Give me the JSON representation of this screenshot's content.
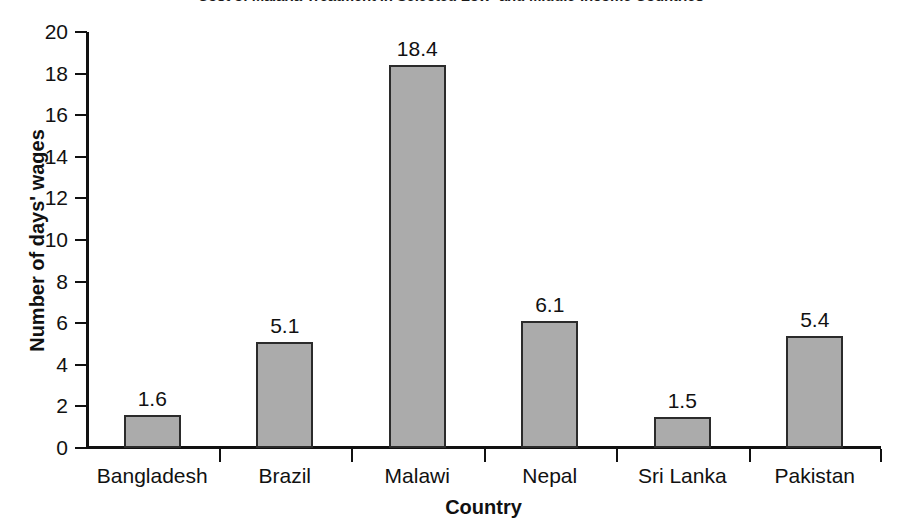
{
  "chart_data": {
    "type": "bar",
    "title": "Cost of Malaria Treatment in Selected Low- and Middle-Income Countries",
    "xlabel": "Country",
    "ylabel": "Number of days' wages",
    "categories": [
      "Bangladesh",
      "Brazil",
      "Malawi",
      "Nepal",
      "Sri Lanka",
      "Pakistan"
    ],
    "values": [
      1.6,
      5.1,
      18.4,
      6.1,
      1.5,
      5.4
    ],
    "value_labels": [
      "1.6",
      "5.1",
      "18.4",
      "6.1",
      "1.5",
      "5.4"
    ],
    "ylim": [
      0,
      20
    ],
    "ytick_values": [
      20,
      18,
      16,
      14,
      12,
      10,
      8,
      6,
      4,
      2,
      0
    ],
    "ytick_labels": [
      "20",
      "18",
      "16",
      "14",
      "12",
      "10",
      "8",
      "6",
      "4",
      "2",
      "0"
    ],
    "grid": false,
    "legend": null,
    "bar_color": "#ababab",
    "bar_border_color": "#2b2b2b",
    "axis_color": "#111111",
    "background_color": "#ffffff"
  }
}
